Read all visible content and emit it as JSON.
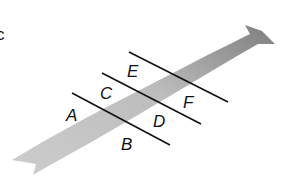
{
  "diagram": {
    "type": "geometry-figure",
    "edge_label": "c",
    "ribbon": {
      "color_light": "#c8c8c8",
      "color_dark": "#8a8a8a"
    },
    "lines": [
      {
        "id": "line-1",
        "x1": 72,
        "y1": 93,
        "x2": 170,
        "y2": 145
      },
      {
        "id": "line-2",
        "x1": 102,
        "y1": 73,
        "x2": 201,
        "y2": 124
      },
      {
        "id": "line-3",
        "x1": 129,
        "y1": 52,
        "x2": 228,
        "y2": 102
      }
    ],
    "labels": [
      {
        "text": "A",
        "x": 66,
        "y": 121
      },
      {
        "text": "B",
        "x": 121,
        "y": 150
      },
      {
        "text": "C",
        "x": 100,
        "y": 99
      },
      {
        "text": "D",
        "x": 153,
        "y": 127
      },
      {
        "text": "E",
        "x": 127,
        "y": 77
      },
      {
        "text": "F",
        "x": 183,
        "y": 108
      }
    ],
    "line_color": "#111111"
  }
}
